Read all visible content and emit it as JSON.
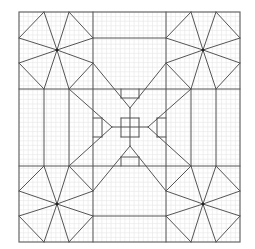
{
  "diagram": {
    "type": "quilt-block-pattern",
    "background": "#ffffff",
    "line_color": "#555555",
    "grid_color": "#e6e6e6",
    "frame": {
      "x": 19,
      "y": 12,
      "width": 221,
      "height": 230
    },
    "grid": {
      "divisions_x": 48,
      "divisions_y": 50
    },
    "segments": [
      [
        19,
        89,
        240,
        89
      ],
      [
        19,
        166,
        240,
        166
      ],
      [
        93,
        12,
        93,
        242
      ],
      [
        166,
        12,
        166,
        242
      ],
      [
        93,
        38,
        166,
        38
      ],
      [
        93,
        216,
        166,
        216
      ],
      [
        44,
        89,
        44,
        166
      ],
      [
        69,
        89,
        69,
        166
      ],
      [
        191,
        89,
        191,
        166
      ],
      [
        216,
        89,
        216,
        166
      ],
      [
        44,
        12,
        57,
        50
      ],
      [
        69,
        12,
        57,
        50
      ],
      [
        19,
        38,
        57,
        50
      ],
      [
        19,
        63,
        57,
        50
      ],
      [
        93,
        38,
        57,
        50
      ],
      [
        93,
        63,
        57,
        50
      ],
      [
        44,
        89,
        57,
        50
      ],
      [
        69,
        89,
        57,
        50
      ],
      [
        44,
        12,
        19,
        38
      ],
      [
        69,
        12,
        93,
        38
      ],
      [
        19,
        63,
        44,
        89
      ],
      [
        93,
        63,
        69,
        89
      ],
      [
        191,
        12,
        203,
        50
      ],
      [
        216,
        12,
        203,
        50
      ],
      [
        166,
        38,
        203,
        50
      ],
      [
        166,
        63,
        203,
        50
      ],
      [
        240,
        38,
        203,
        50
      ],
      [
        240,
        63,
        203,
        50
      ],
      [
        191,
        89,
        203,
        50
      ],
      [
        216,
        89,
        203,
        50
      ],
      [
        191,
        12,
        166,
        38
      ],
      [
        216,
        12,
        240,
        38
      ],
      [
        166,
        63,
        191,
        89
      ],
      [
        240,
        63,
        216,
        89
      ],
      [
        44,
        166,
        57,
        204
      ],
      [
        69,
        166,
        57,
        204
      ],
      [
        19,
        191,
        57,
        204
      ],
      [
        19,
        216,
        57,
        204
      ],
      [
        93,
        191,
        57,
        204
      ],
      [
        93,
        216,
        57,
        204
      ],
      [
        44,
        242,
        57,
        204
      ],
      [
        69,
        242,
        57,
        204
      ],
      [
        44,
        166,
        19,
        191
      ],
      [
        69,
        166,
        93,
        191
      ],
      [
        19,
        216,
        44,
        242
      ],
      [
        93,
        216,
        69,
        242
      ],
      [
        191,
        166,
        203,
        204
      ],
      [
        216,
        166,
        203,
        204
      ],
      [
        166,
        191,
        203,
        204
      ],
      [
        166,
        216,
        203,
        204
      ],
      [
        240,
        191,
        203,
        204
      ],
      [
        240,
        216,
        203,
        204
      ],
      [
        191,
        242,
        203,
        204
      ],
      [
        216,
        242,
        203,
        204
      ],
      [
        191,
        166,
        166,
        191
      ],
      [
        216,
        166,
        240,
        191
      ],
      [
        166,
        216,
        191,
        242
      ],
      [
        240,
        216,
        216,
        242
      ],
      [
        93,
        63,
        130,
        108
      ],
      [
        69,
        89,
        112,
        127
      ],
      [
        166,
        63,
        130,
        108
      ],
      [
        191,
        89,
        148,
        127
      ],
      [
        69,
        166,
        112,
        127
      ],
      [
        93,
        191,
        130,
        146
      ],
      [
        191,
        166,
        148,
        127
      ],
      [
        166,
        191,
        130,
        146
      ],
      [
        112,
        127,
        148,
        127
      ],
      [
        130,
        108,
        130,
        146
      ],
      [
        121,
        118,
        139,
        118
      ],
      [
        139,
        118,
        139,
        137
      ],
      [
        139,
        137,
        121,
        137
      ],
      [
        121,
        137,
        121,
        118
      ],
      [
        121,
        89,
        121,
        98
      ],
      [
        139,
        89,
        139,
        98
      ],
      [
        121,
        98,
        139,
        98
      ],
      [
        121,
        166,
        121,
        157
      ],
      [
        139,
        166,
        139,
        157
      ],
      [
        121,
        157,
        139,
        157
      ],
      [
        93,
        118,
        102,
        118
      ],
      [
        93,
        137,
        102,
        137
      ],
      [
        102,
        118,
        102,
        137
      ],
      [
        166,
        118,
        157,
        118
      ],
      [
        166,
        137,
        157,
        137
      ],
      [
        157,
        118,
        157,
        137
      ]
    ],
    "centers": [
      {
        "label": "top-left-star",
        "x": 57,
        "y": 50
      },
      {
        "label": "top-right-star",
        "x": 203,
        "y": 50
      },
      {
        "label": "bottom-left-star",
        "x": 57,
        "y": 204
      },
      {
        "label": "bottom-right-star",
        "x": 203,
        "y": 204
      }
    ]
  }
}
